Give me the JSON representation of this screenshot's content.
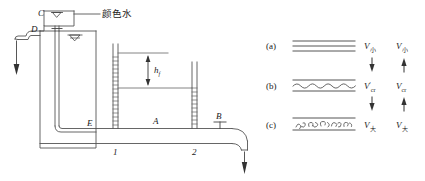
{
  "figure": {
    "title_note": "Reynolds experiment apparatus with flow-regime diagrams",
    "stroke_color": "#4a4a4a",
    "text_color": "#1a1a1a"
  },
  "apparatus": {
    "labels": {
      "colored_water": "颜色水",
      "point_c": "C",
      "point_d": "D",
      "point_e": "E",
      "point_a": "A",
      "point_b": "B",
      "head_loss": "h",
      "head_loss_sub": "f",
      "tube_1": "1",
      "tube_2": "2"
    },
    "icons": {
      "free_surface": "free-surface-triangle-icon",
      "valve": "valve-icon",
      "flow_arrow": "flow-arrow-icon"
    }
  },
  "flow_regimes": {
    "rows": [
      {
        "id": "a",
        "label": "(a)",
        "pattern": "straight-lines",
        "left_symbol": "V",
        "left_sub": "小",
        "left_prime": "",
        "right_symbol": "V",
        "right_sub": "小",
        "arrow_left": "down",
        "arrow_right": "up"
      },
      {
        "id": "b",
        "label": "(b)",
        "pattern": "wavy-line",
        "left_symbol": "V",
        "left_sub": "cr",
        "left_prime": "′",
        "right_symbol": "V",
        "right_sub": "cr",
        "arrow_left": "down",
        "arrow_right": "up"
      },
      {
        "id": "c",
        "label": "(c)",
        "pattern": "turbulent-squiggles",
        "left_symbol": "V",
        "left_sub": "大",
        "left_prime": "",
        "right_symbol": "V",
        "right_sub": "大",
        "arrow_left": "",
        "arrow_right": ""
      }
    ]
  }
}
